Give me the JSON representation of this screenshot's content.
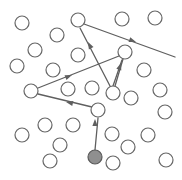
{
  "canvas": {
    "width": 182,
    "height": 180,
    "background": "#ffffff"
  },
  "style": {
    "node_stroke": "#666666",
    "node_fill": "#ffffff",
    "node_radius": 7,
    "node_stroke_width": 1.2,
    "start_node_fill": "#8f8f8f",
    "start_node_stroke": "#5a5a5a",
    "path_stroke": "#5f5f5f",
    "path_stroke_width": 1.3,
    "arrow_fill": "#5f5f5f"
  },
  "legend": {
    "start_node_label": "start-node",
    "open_node_label": "node",
    "path_label": "traversal-path"
  },
  "nodes": [
    {
      "id": "n1",
      "cx": 22,
      "cy": 23,
      "filled": false
    },
    {
      "id": "n2",
      "cx": 57,
      "cy": 35,
      "filled": false
    },
    {
      "id": "n3",
      "cx": 35,
      "cy": 50,
      "filled": false
    },
    {
      "id": "n4",
      "cx": 78,
      "cy": 20,
      "filled": false
    },
    {
      "id": "n5",
      "cx": 122,
      "cy": 19,
      "filled": false
    },
    {
      "id": "n6",
      "cx": 155,
      "cy": 18,
      "filled": false
    },
    {
      "id": "n7",
      "cx": 78,
      "cy": 55,
      "filled": false
    },
    {
      "id": "n8",
      "cx": 125,
      "cy": 52,
      "filled": false
    },
    {
      "id": "n9",
      "cx": 17,
      "cy": 66,
      "filled": false
    },
    {
      "id": "n10",
      "cx": 53,
      "cy": 70,
      "filled": false
    },
    {
      "id": "n11",
      "cx": 144,
      "cy": 70,
      "filled": false
    },
    {
      "id": "n12",
      "cx": 31,
      "cy": 91,
      "filled": false
    },
    {
      "id": "n13",
      "cx": 68,
      "cy": 89,
      "filled": false
    },
    {
      "id": "n14",
      "cx": 92,
      "cy": 88,
      "filled": false
    },
    {
      "id": "n15",
      "cx": 113,
      "cy": 93,
      "filled": false
    },
    {
      "id": "n16",
      "cx": 160,
      "cy": 90,
      "filled": false
    },
    {
      "id": "n17",
      "cx": 98,
      "cy": 110,
      "filled": false
    },
    {
      "id": "n18",
      "cx": 131,
      "cy": 98,
      "filled": false
    },
    {
      "id": "n19",
      "cx": 165,
      "cy": 112,
      "filled": false
    },
    {
      "id": "n20",
      "cx": 45,
      "cy": 125,
      "filled": false
    },
    {
      "id": "n21",
      "cx": 73,
      "cy": 125,
      "filled": false
    },
    {
      "id": "n22",
      "cx": 112,
      "cy": 134,
      "filled": false
    },
    {
      "id": "n23",
      "cx": 148,
      "cy": 135,
      "filled": false
    },
    {
      "id": "n24",
      "cx": 22,
      "cy": 135,
      "filled": false
    },
    {
      "id": "n25",
      "cx": 128,
      "cy": 147,
      "filled": false
    },
    {
      "id": "n26",
      "cx": 60,
      "cy": 145,
      "filled": false
    },
    {
      "id": "n27",
      "cx": 50,
      "cy": 161,
      "filled": false
    },
    {
      "id": "n28",
      "cx": 113,
      "cy": 163,
      "filled": false
    },
    {
      "id": "n29",
      "cx": 166,
      "cy": 160,
      "filled": false
    },
    {
      "id": "start",
      "cx": 95,
      "cy": 157,
      "filled": true
    }
  ],
  "path_segments": [
    {
      "id": "seg1",
      "from": "start",
      "to": "n17",
      "x1": 95,
      "y1": 150,
      "x2": 98,
      "y2": 118,
      "arrow": true
    },
    {
      "id": "seg2",
      "from": "n17",
      "to": "n12",
      "x1": 92,
      "y1": 107,
      "x2": 38,
      "y2": 94,
      "arrow": true
    },
    {
      "id": "seg3",
      "from": "n12",
      "to": "n8",
      "x1": 38,
      "y1": 88,
      "x2": 119,
      "y2": 56,
      "arrow": true
    },
    {
      "id": "seg4",
      "from": "n8",
      "to": "n15",
      "x1": 123,
      "y1": 59,
      "x2": 115,
      "y2": 86,
      "arrow": false
    },
    {
      "id": "seg5",
      "from": "n15",
      "to": "n8",
      "x1": 113,
      "y1": 86,
      "x2": 122,
      "y2": 60,
      "arrow": true
    },
    {
      "id": "seg6",
      "from": "n15",
      "to": "n4",
      "x1": 110,
      "y1": 86,
      "x2": 80,
      "y2": 28,
      "arrow": true
    },
    {
      "id": "seg7",
      "from": "n4",
      "to": "n8",
      "x1": 84,
      "y1": 24,
      "x2": 175,
      "y2": 57,
      "arrow": true
    }
  ],
  "arrowheads": [
    {
      "id": "ah1",
      "x": 95,
      "y": 119,
      "angle": -90,
      "on": "seg1"
    },
    {
      "id": "ah2",
      "x": 66,
      "y": 102,
      "angle": 193,
      "on": "seg2"
    },
    {
      "id": "ah3",
      "x": 72,
      "y": 75,
      "angle": -22,
      "on": "seg3"
    },
    {
      "id": "ah4",
      "x": 121,
      "y": 63,
      "angle": -72,
      "on": "seg5"
    },
    {
      "id": "ah5",
      "x": 88,
      "y": 42,
      "angle": -117,
      "on": "seg6"
    },
    {
      "id": "ah6",
      "x": 136,
      "y": 42,
      "angle": 20,
      "on": "seg7"
    }
  ],
  "counts": {
    "total_nodes": 30,
    "open_nodes": 29,
    "filled_nodes": 1,
    "segments": 7,
    "arrowheads": 6
  }
}
